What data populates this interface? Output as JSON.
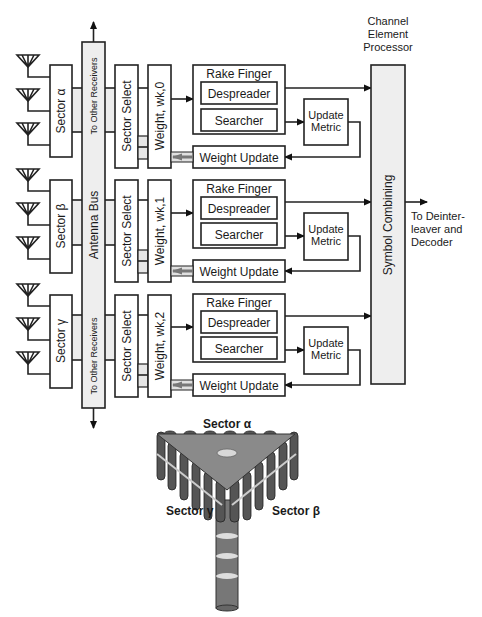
{
  "title": {
    "cep_line1": "Channel",
    "cep_line2": "Element",
    "cep_line3": "Processor"
  },
  "antenna_bus": {
    "label": "Antenna Bus",
    "to_other_top": "To Other Receivers",
    "to_other_bottom": "To Other Receivers"
  },
  "sectors": [
    {
      "label": "Sector α"
    },
    {
      "label": "Sector β"
    },
    {
      "label": "Sector γ"
    }
  ],
  "fingers": [
    {
      "sector_select": "Sector Select",
      "weight": "Weight, wk,0",
      "rake_finger": "Rake Finger",
      "despreader": "Despreader",
      "searcher": "Searcher",
      "update_metric_1": "Update",
      "update_metric_2": "Metric",
      "weight_update": "Weight Update"
    },
    {
      "sector_select": "Sector Select",
      "weight": "Weight, wk,1",
      "rake_finger": "Rake Finger",
      "despreader": "Despreader",
      "searcher": "Searcher",
      "update_metric_1": "Update",
      "update_metric_2": "Metric",
      "weight_update": "Weight Update"
    },
    {
      "sector_select": "Sector Select",
      "weight": "Weight, wk,2",
      "rake_finger": "Rake Finger",
      "despreader": "Despreader",
      "searcher": "Searcher",
      "update_metric_1": "Update",
      "update_metric_2": "Metric",
      "weight_update": "Weight Update"
    }
  ],
  "symbol_combining": "Symbol Combining",
  "output": {
    "line1": "To Deinter-",
    "line2": "leaver and",
    "line3": "Decoder"
  },
  "tower": {
    "sector_alpha": "Sector α",
    "sector_beta": "Sector β",
    "sector_gamma": "Sector γ"
  }
}
